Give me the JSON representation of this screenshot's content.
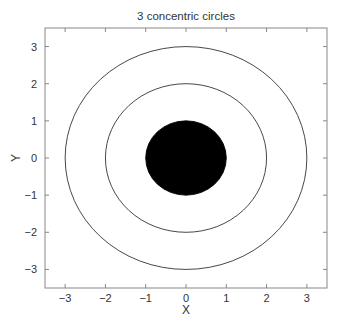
{
  "chart_data": {
    "type": "line",
    "title": "3 concentric circles",
    "xlabel": "X",
    "ylabel": "Y",
    "xlim": [
      -3.5,
      3.5
    ],
    "ylim": [
      -3.5,
      3.5
    ],
    "xticks": [
      -3,
      -2,
      -1,
      0,
      1,
      2,
      3
    ],
    "yticks": [
      -3,
      -2,
      -1,
      0,
      1,
      2,
      3
    ],
    "xtick_labels": [
      "−3",
      "−2",
      "−1",
      "0",
      "1",
      "2",
      "3"
    ],
    "ytick_labels": [
      "−3",
      "−2",
      "−1",
      "0",
      "1",
      "2",
      "3"
    ],
    "grid": false,
    "legend": null,
    "series": [
      {
        "name": "circle r=1 (filled)",
        "center": [
          0,
          0
        ],
        "radius": 1,
        "filled": true,
        "color": "#000000"
      },
      {
        "name": "circle r=2",
        "center": [
          0,
          0
        ],
        "radius": 2,
        "filled": false,
        "color": "#333333"
      },
      {
        "name": "circle r=3",
        "center": [
          0,
          0
        ],
        "radius": 3,
        "filled": false,
        "color": "#333333"
      }
    ]
  },
  "colors": {
    "axis": "#888888",
    "text": "#333333",
    "fill": "#000000"
  }
}
